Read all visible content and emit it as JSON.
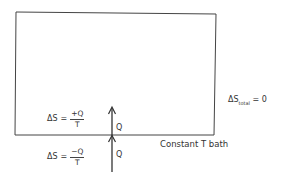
{
  "diagram": {
    "system_box": {
      "label": ""
    },
    "heat_labels": {
      "upper": "Q",
      "lower": "Q"
    },
    "system_entropy": {
      "lhs": "ΔS",
      "equals": "=",
      "numerator": "+Q",
      "denominator": "T"
    },
    "bath_entropy": {
      "lhs": "ΔS",
      "equals": "=",
      "numerator": "−Q",
      "denominator": "T"
    },
    "total_entropy": {
      "lhs": "ΔS",
      "subscript": "total",
      "rhs": "= 0"
    },
    "bath_label": "Constant T bath"
  }
}
